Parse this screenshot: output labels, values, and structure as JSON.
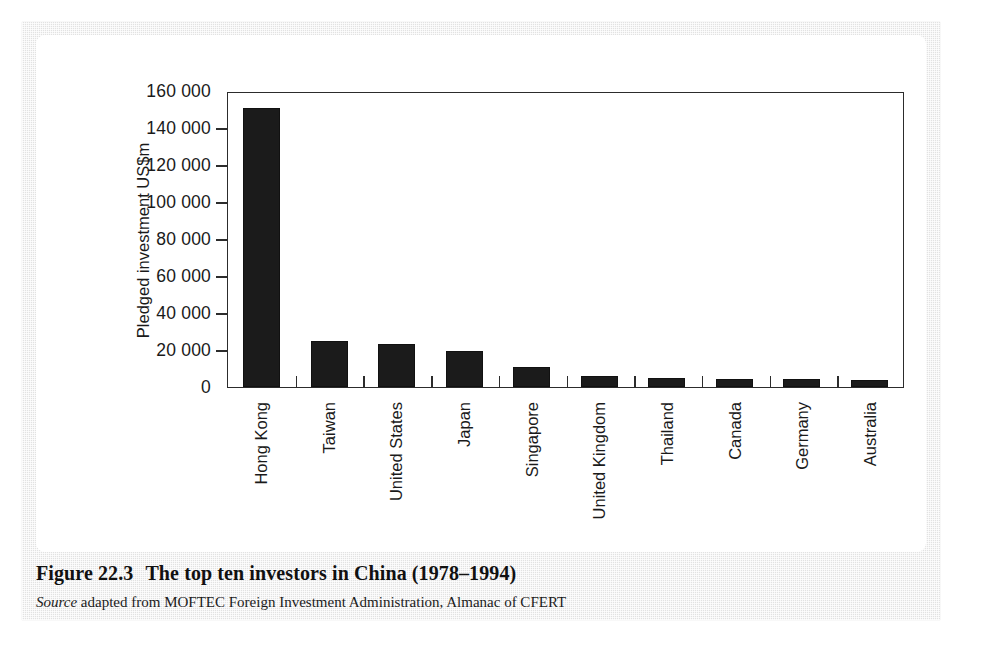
{
  "figure": {
    "caption_number": "Figure 22.3",
    "caption_title": "The top ten investors in China (1978–1994)",
    "source_word": "Source",
    "source_text": " adapted from MOFTEC Foreign Investment Administration, Almanac of CFERT"
  },
  "chart_data": {
    "type": "bar",
    "title": "The top ten investors in China (1978–1994)",
    "xlabel": "",
    "ylabel": "Pledged investment US$m",
    "ylim": [
      0,
      160000
    ],
    "grid": false,
    "legend": false,
    "categories": [
      "Hong Kong",
      "Taiwan",
      "United States",
      "Japan",
      "Singapore",
      "United Kingdom",
      "Thailand",
      "Canada",
      "Germany",
      "Australia"
    ],
    "values": [
      151000,
      25000,
      23500,
      19500,
      11000,
      6000,
      4800,
      4500,
      4200,
      3800
    ],
    "ytick_values": [
      0,
      20000,
      40000,
      60000,
      80000,
      100000,
      120000,
      140000,
      160000
    ],
    "ytick_labels": [
      "0",
      "20 000",
      "40 000",
      "60 000",
      "80 000",
      "100 000",
      "120 000",
      "140 000",
      "160 000"
    ],
    "bar_color": "#1b1b1b",
    "axis_color": "#2c2c2c",
    "plot_background": "#ffffff"
  }
}
